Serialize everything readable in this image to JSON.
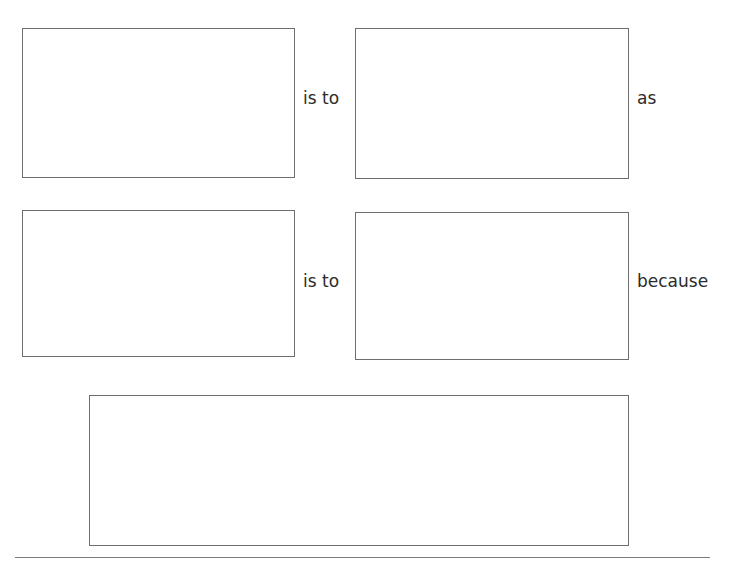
{
  "worksheet": {
    "type": "analogy-organizer",
    "row1": {
      "connector_1": "is to",
      "connector_2": "as"
    },
    "row2": {
      "connector_1": "is to",
      "connector_2": "because"
    },
    "boxes": [
      {
        "id": "term-a",
        "value": ""
      },
      {
        "id": "term-b",
        "value": ""
      },
      {
        "id": "term-c",
        "value": ""
      },
      {
        "id": "term-d",
        "value": ""
      },
      {
        "id": "explanation",
        "value": ""
      }
    ]
  }
}
